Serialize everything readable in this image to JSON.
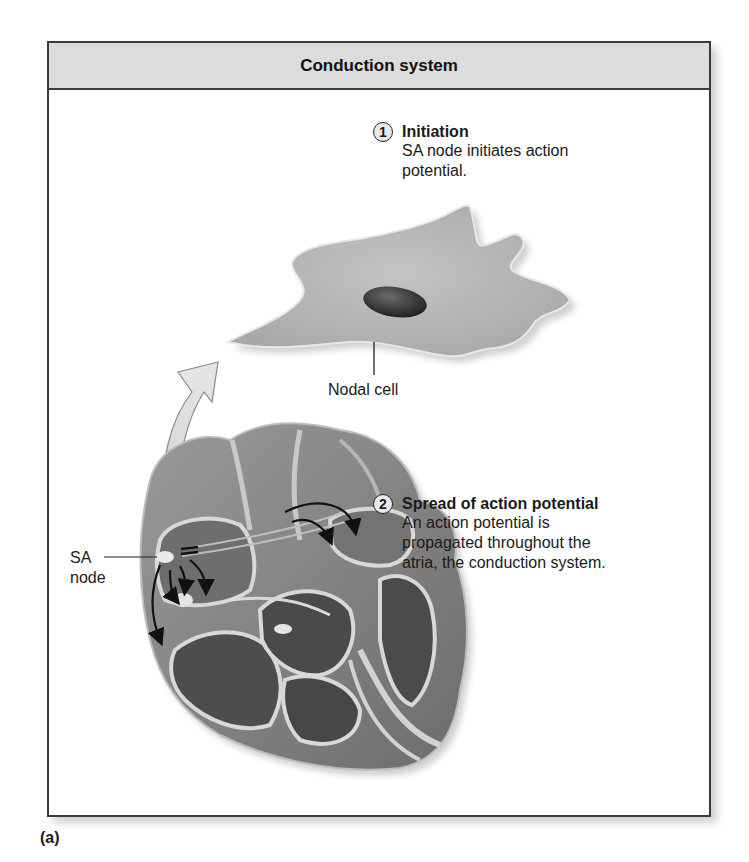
{
  "figure": {
    "header_title": "Conduction system",
    "panel_label": "(a)",
    "steps": [
      {
        "number": "1",
        "title": "Initiation",
        "body_lines": [
          "SA node initiates action",
          "potential."
        ]
      },
      {
        "number": "2",
        "title": "Spread of action potential",
        "body_lines": [
          "An action potential is",
          "propagated throughout the",
          "atria, the conduction system."
        ]
      }
    ],
    "labels": {
      "nodal_cell": "Nodal cell",
      "sa_node_line1": "SA",
      "sa_node_line2": "node"
    },
    "illustrations": {
      "cell": "nodal-cell-illustration",
      "heart": "heart-cross-section-illustration",
      "arrow": "curved-magnify-arrow"
    },
    "colors": {
      "header_bg": "#dcdcdc",
      "frame_border": "#3a3a3a",
      "cell_fill": "#b9b9b9",
      "nucleus": "#2e2e2e",
      "heart_dark": "#4a4a4a",
      "heart_mid": "#8a8a8a",
      "heart_light": "#d6d6d6"
    }
  }
}
